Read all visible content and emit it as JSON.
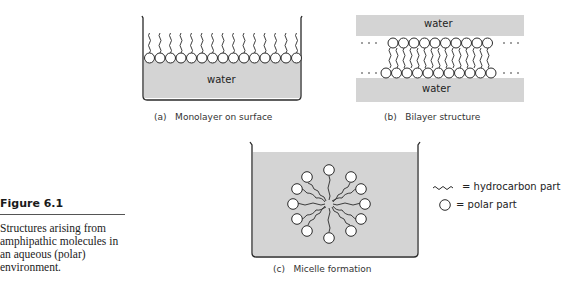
{
  "figure": {
    "number": "Figure 6.1",
    "caption": "Structures arising from amphipathic molecules in an aqueous (polar) environment."
  },
  "panels": {
    "a": {
      "label": "(a)   Monolayer on surface",
      "water": "water"
    },
    "b": {
      "label": "(b)   Bilayer structure",
      "water_top": "water",
      "water_bottom": "water"
    },
    "c": {
      "label": "(c)   Micelle formation"
    }
  },
  "legend": {
    "hydrocarbon": "= hydrocarbon part",
    "polar": "= polar part"
  },
  "colors": {
    "water_fill": "#d4d4d4",
    "outline": "#2a2a2a"
  }
}
